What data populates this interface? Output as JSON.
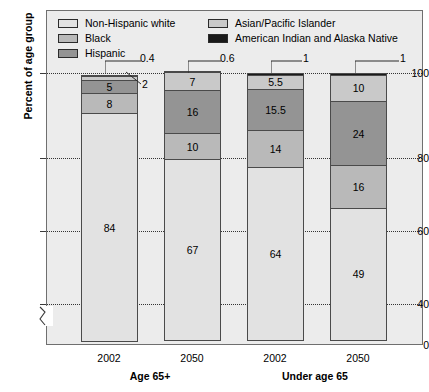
{
  "chart_data": {
    "type": "bar",
    "subtype": "stacked-column-100",
    "title": "",
    "xlabel": "",
    "ylabel": "Percent of age group",
    "ylim": [
      0,
      100
    ],
    "y_ticks": [
      0,
      40,
      60,
      80,
      100
    ],
    "y_tick_labels": [
      "0",
      "40",
      "60",
      "80",
      "100"
    ],
    "axis_break": true,
    "axis_break_between": [
      0,
      40
    ],
    "grid": true,
    "grid_style": "dotted-horizontal",
    "legend_position": "top-inside",
    "categories": [
      "2002",
      "2050",
      "2002",
      "2050"
    ],
    "groups": [
      {
        "label": "Age 65+",
        "categories": [
          "2002",
          "2050"
        ]
      },
      {
        "label": "Under age 65",
        "categories": [
          "2002",
          "2050"
        ]
      }
    ],
    "series": [
      {
        "name": "Non-Hispanic white",
        "color": "#e2e2e2",
        "values": [
          84,
          67,
          64,
          49
        ]
      },
      {
        "name": "Black",
        "color": "#b9b9b9",
        "values": [
          8,
          10,
          14,
          16
        ]
      },
      {
        "name": "Hispanic",
        "color": "#949494",
        "values": [
          5,
          16,
          15.5,
          24
        ]
      },
      {
        "name": "Asian/Pacific Islander",
        "color": "#c9c9c9",
        "values": [
          2,
          7,
          5.5,
          10
        ]
      },
      {
        "name": "American Indian and Alaska Native",
        "color": "#1a1a1a",
        "values": [
          0.4,
          0.6,
          1,
          1
        ]
      }
    ],
    "bar_labels": [
      [
        "84",
        "8",
        "5",
        "2",
        "0.4"
      ],
      [
        "67",
        "10",
        "16",
        "7",
        "0.6"
      ],
      [
        "64",
        "14",
        "15.5",
        "5.5",
        "1"
      ],
      [
        "49",
        "16",
        "24",
        "10",
        "1"
      ]
    ],
    "callouts": [
      {
        "text": "0.4",
        "series": "American Indian and Alaska Native",
        "bar": 0
      },
      {
        "text": "2",
        "series": "Asian/Pacific Islander",
        "bar": 0
      },
      {
        "text": "0.6",
        "series": "American Indian and Alaska Native",
        "bar": 1
      },
      {
        "text": "1",
        "series": "American Indian and Alaska Native",
        "bar": 2
      },
      {
        "text": "1",
        "series": "American Indian and Alaska Native",
        "bar": 3
      }
    ]
  },
  "legend": {
    "left_column": [
      {
        "label": "Non-Hispanic white",
        "color": "#e2e2e2"
      },
      {
        "label": "Black",
        "color": "#b9b9b9"
      },
      {
        "label": "Hispanic",
        "color": "#949494"
      }
    ],
    "right_column": [
      {
        "label": "Asian/Pacific Islander",
        "color": "#c9c9c9"
      },
      {
        "label": "American Indian and Alaska Native",
        "color": "#1a1a1a"
      }
    ]
  },
  "axes": {
    "y_title": "Percent of age group",
    "y_labels": [
      "100",
      "80",
      "60",
      "40",
      "0"
    ]
  },
  "x_axis": {
    "tick_labels": [
      "2002",
      "2050",
      "2002",
      "2050"
    ],
    "group_labels": [
      "Age 65+",
      "Under age 65"
    ]
  }
}
